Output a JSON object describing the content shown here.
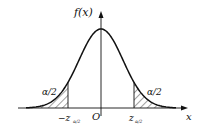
{
  "chart_data": {
    "type": "area",
    "curve": "normal pdf",
    "ylabel": "f(x)",
    "xlabel": "x",
    "origin_label": "O",
    "critical_values": {
      "left_label": "-z",
      "left_subscript": "α/2",
      "right_label": "z",
      "right_subscript": "α/2"
    },
    "shaded_regions": [
      {
        "side": "left",
        "label": "α/2",
        "pattern": "hatched"
      },
      {
        "side": "right",
        "label": "α/2",
        "pattern": "hatched"
      }
    ],
    "grid": false,
    "legend": "none"
  },
  "labels": {
    "y_axis": "f(x)",
    "x_axis": "x",
    "origin": "O",
    "left_tail_area": "α/2",
    "right_tail_area": "α/2",
    "left_crit_main": "−z",
    "left_crit_sub": "α/2",
    "right_crit_main": "z",
    "right_crit_sub": "α/2"
  },
  "colors": {
    "line": "#111111",
    "background": "#ffffff"
  }
}
